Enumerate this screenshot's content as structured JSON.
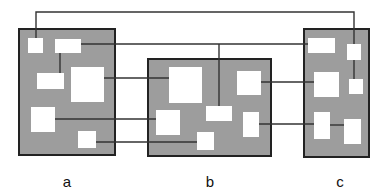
{
  "diagram": {
    "colors": {
      "panel_fill": "#9d9d9d",
      "panel_border": "#222222",
      "box_fill": "#ffffff",
      "connector": "#333333"
    },
    "panels": [
      {
        "id": "a",
        "label": "a",
        "x": 18,
        "y": 28,
        "w": 98,
        "h": 128,
        "label_x": 67,
        "label_y": 174,
        "boxes": [
          {
            "id": "a1",
            "x": 28,
            "y": 38,
            "w": 15,
            "h": 15
          },
          {
            "id": "a2",
            "x": 55,
            "y": 39,
            "w": 26,
            "h": 14
          },
          {
            "id": "a3",
            "x": 37,
            "y": 73,
            "w": 27,
            "h": 16
          },
          {
            "id": "a4",
            "x": 71,
            "y": 67,
            "w": 33,
            "h": 35
          },
          {
            "id": "a5",
            "x": 31,
            "y": 107,
            "w": 24,
            "h": 25
          },
          {
            "id": "a6",
            "x": 78,
            "y": 131,
            "w": 18,
            "h": 17
          }
        ]
      },
      {
        "id": "b",
        "label": "b",
        "x": 147,
        "y": 58,
        "w": 125,
        "h": 99,
        "label_x": 210,
        "label_y": 174,
        "boxes": [
          {
            "id": "b1",
            "x": 169,
            "y": 67,
            "w": 33,
            "h": 36
          },
          {
            "id": "b2",
            "x": 237,
            "y": 71,
            "w": 24,
            "h": 24
          },
          {
            "id": "b3",
            "x": 206,
            "y": 106,
            "w": 26,
            "h": 15
          },
          {
            "id": "b4",
            "x": 156,
            "y": 110,
            "w": 24,
            "h": 25
          },
          {
            "id": "b5",
            "x": 243,
            "y": 112,
            "w": 16,
            "h": 25
          },
          {
            "id": "b6",
            "x": 197,
            "y": 132,
            "w": 17,
            "h": 18
          }
        ]
      },
      {
        "id": "c",
        "label": "c",
        "x": 303,
        "y": 28,
        "w": 67,
        "h": 130,
        "label_x": 340,
        "label_y": 174,
        "boxes": [
          {
            "id": "c1",
            "x": 308,
            "y": 38,
            "w": 27,
            "h": 15
          },
          {
            "id": "c2",
            "x": 347,
            "y": 44,
            "w": 14,
            "h": 16
          },
          {
            "id": "c3",
            "x": 314,
            "y": 72,
            "w": 25,
            "h": 25
          },
          {
            "id": "c4",
            "x": 349,
            "y": 79,
            "w": 14,
            "h": 15
          },
          {
            "id": "c5",
            "x": 314,
            "y": 112,
            "w": 16,
            "h": 27
          },
          {
            "id": "c6",
            "x": 344,
            "y": 119,
            "w": 17,
            "h": 25
          }
        ]
      }
    ],
    "connectors": [
      {
        "id": "a1-c2",
        "points": [
          [
            36,
            38
          ],
          [
            36,
            12
          ],
          [
            354,
            12
          ],
          [
            354,
            44
          ]
        ]
      },
      {
        "id": "a2-c1",
        "points": [
          [
            81,
            44
          ],
          [
            308,
            44
          ]
        ]
      },
      {
        "id": "b3-top",
        "points": [
          [
            219,
            44
          ],
          [
            219,
            106
          ]
        ]
      },
      {
        "id": "a2-a3",
        "points": [
          [
            60,
            53
          ],
          [
            60,
            73
          ]
        ]
      },
      {
        "id": "a4-b1",
        "points": [
          [
            104,
            78
          ],
          [
            169,
            78
          ]
        ]
      },
      {
        "id": "b2-c3",
        "points": [
          [
            261,
            82
          ],
          [
            314,
            82
          ]
        ]
      },
      {
        "id": "c2-c4",
        "points": [
          [
            354,
            60
          ],
          [
            354,
            79
          ]
        ]
      },
      {
        "id": "a5-b4",
        "points": [
          [
            55,
            119
          ],
          [
            156,
            119
          ]
        ]
      },
      {
        "id": "b5-c5",
        "points": [
          [
            259,
            124
          ],
          [
            314,
            124
          ]
        ]
      },
      {
        "id": "c5-c6",
        "points": [
          [
            330,
            125
          ],
          [
            344,
            125
          ]
        ]
      },
      {
        "id": "a6-b6",
        "points": [
          [
            96,
            142
          ],
          [
            197,
            142
          ]
        ]
      }
    ]
  }
}
